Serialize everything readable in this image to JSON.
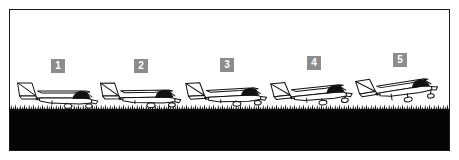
{
  "figure": {
    "background_color": "#ffffff",
    "frame_border_color": "#1a1a1a",
    "sky_color": "#ffffff",
    "ground_color": "#050505",
    "grass_color": "#0d0d0d",
    "label_background_color": "#8c8c8c",
    "label_text_color": "#ffffff",
    "aircraft_outline_color": "#111111",
    "aircraft_fill_color": "#ffffff",
    "canopy_fill_color": "#111111"
  },
  "steps": [
    {
      "label": "1",
      "label_x": 41,
      "label_y": 49,
      "plane_x": 6,
      "plane_y": 67,
      "rotation": 0,
      "name": "ground-roll"
    },
    {
      "label": "2",
      "label_x": 124,
      "label_y": 49,
      "plane_x": 89,
      "plane_y": 66,
      "rotation": -1,
      "name": "acceleration"
    },
    {
      "label": "3",
      "label_x": 210,
      "label_y": 48,
      "plane_x": 175,
      "plane_y": 64,
      "rotation": -3,
      "name": "nose-wheel-lift"
    },
    {
      "label": "4",
      "label_x": 297,
      "label_y": 46,
      "plane_x": 261,
      "plane_y": 61,
      "rotation": -6,
      "name": "rotation"
    },
    {
      "label": "5",
      "label_x": 383,
      "label_y": 43,
      "plane_x": 347,
      "plane_y": 56,
      "rotation": -9,
      "name": "lift-off"
    }
  ],
  "chart_data": {
    "type": "scatter",
    "xlabel": "Distance along runway",
    "ylabel": "Pitch attitude / height",
    "categories": [
      "1",
      "2",
      "3",
      "4",
      "5"
    ],
    "series": [
      {
        "name": "Pitch attitude (degrees, nose-up)",
        "values": [
          0,
          1,
          3,
          6,
          9
        ]
      },
      {
        "name": "Height above ground (relative)",
        "values": [
          0,
          1,
          3,
          6,
          11
        ]
      }
    ],
    "grid": false,
    "legend": "none"
  }
}
